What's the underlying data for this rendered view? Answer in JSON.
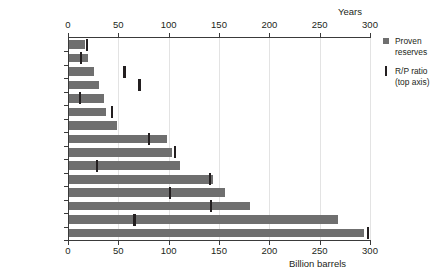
{
  "chart_data": {
    "type": "bar",
    "orientation": "horizontal",
    "title": "",
    "categories": [
      "Brazil",
      "China",
      "Qatar",
      "Kazakhstan",
      "United States",
      "Nigeria",
      "Libya",
      "UAE",
      "Kuwait",
      "Russia",
      "Iraq",
      "Iran",
      "Canada",
      "Saudi Arabia",
      "Venezuela"
    ],
    "series": [
      {
        "name": "Proven reserves",
        "unit": "Billion barrels",
        "axis": "bottom",
        "color": "#6f6f6f",
        "values": [
          16,
          19,
          25,
          30,
          35,
          37,
          48,
          97,
          102,
          110,
          143,
          155,
          180,
          267,
          293
        ]
      },
      {
        "name": "R/P ratio (top axis)",
        "unit": "Years",
        "axis": "top",
        "color": "#231f20",
        "marker": "tick",
        "values": [
          18,
          12,
          55,
          70,
          11,
          43,
          null,
          79,
          105,
          28,
          140,
          100,
          141,
          65,
          297
        ]
      }
    ],
    "x_bottom": {
      "label": "Billion barrels",
      "ticks": [
        0,
        50,
        100,
        150,
        200,
        250,
        300
      ],
      "min": 0,
      "max": 300
    },
    "x_top": {
      "label": "Years",
      "ticks": [
        0,
        50,
        100,
        150,
        200,
        250,
        300
      ],
      "min": 0,
      "max": 300
    },
    "grid": "vertical",
    "legend_position": "right"
  },
  "legend": {
    "entries": [
      {
        "line1": "Proven",
        "line2": "reserves"
      },
      {
        "line1": "R/P ratio",
        "line2": "(top axis)"
      }
    ]
  }
}
